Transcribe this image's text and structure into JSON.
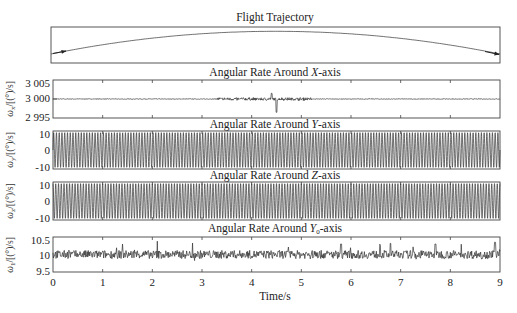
{
  "figure": {
    "xlabel": "Time/s",
    "x_ticks": [
      "0",
      "1",
      "2",
      "3",
      "4",
      "5",
      "6",
      "7",
      "8",
      "9"
    ]
  },
  "chart_data": [
    {
      "type": "line",
      "title": "Flight Trajectory",
      "xlabel": "",
      "ylabel": "",
      "description": "Gentle arc from left to right with arrowheads at both ends; apex near center",
      "x": [
        0,
        1.5,
        3,
        4.5,
        6,
        7.5,
        9
      ],
      "values": [
        0.25,
        0.58,
        0.8,
        0.88,
        0.8,
        0.58,
        0.25
      ],
      "grid": false
    },
    {
      "type": "line",
      "title": "Angular Rate Around X-axis",
      "title_parts": [
        "Angular Rate Around ",
        "X",
        "-axis"
      ],
      "ylabel": "ωx/[(°)/s]",
      "ylabel_sym": "ω",
      "ylabel_sub": "x",
      "ylabel_unit": "/[(°)/s]",
      "y_ticks": [
        "3 005",
        "3 000",
        "2 995"
      ],
      "ylim": [
        2995,
        3005
      ],
      "xlim": [
        0,
        9
      ],
      "baseline": 3000,
      "description": "Near-constant ~3000 with small noise; disturbance between 3.5 s and 5 s, positive spike ~+1.5 at 4.4 s and negative spike ~-3.5 at 4.5 s",
      "events": [
        {
          "t": 4.4,
          "value": 3001.5
        },
        {
          "t": 4.5,
          "value": 2996.5
        }
      ],
      "grid": false
    },
    {
      "type": "line",
      "title": "Angular Rate Around Y-axis",
      "title_parts": [
        "Angular Rate Around ",
        "Y",
        "-axis"
      ],
      "ylabel": "ωy/[(°)/s]",
      "ylabel_sym": "ω",
      "ylabel_sub": "y",
      "ylabel_unit": "/[(°)/s]",
      "y_ticks": [
        "10",
        "0",
        "-10"
      ],
      "ylim": [
        -12,
        12
      ],
      "xlim": [
        0,
        9
      ],
      "description": "Sinusoid amplitude ~11 (°)/s, ~18 cycles per second",
      "amplitude": 11,
      "frequency_hz": 18,
      "phase": 0,
      "grid": false
    },
    {
      "type": "line",
      "title": "Angular Rate Around Z-axis",
      "title_parts": [
        "Angular Rate Around ",
        "Z",
        "-axis"
      ],
      "ylabel": "ωz/[(°)/s]",
      "ylabel_sym": "ω",
      "ylabel_sub": "z",
      "ylabel_unit": "/[(°)/s]",
      "y_ticks": [
        "10",
        "0",
        "-10"
      ],
      "ylim": [
        -12,
        12
      ],
      "xlim": [
        0,
        9
      ],
      "description": "Sinusoid amplitude ~11 (°)/s, ~18 cycles per second, quarter-phase shifted from Y",
      "amplitude": 11,
      "frequency_hz": 18,
      "phase": 1.5708,
      "grid": false
    },
    {
      "type": "line",
      "title": "Angular Rate Around Y0-axis",
      "title_parts": [
        "Angular Rate Around ",
        "Y",
        "0",
        "-axis"
      ],
      "ylabel": "ω1/[(°)/s]",
      "ylabel_sym": "ω",
      "ylabel_sub": "1",
      "ylabel_unit": "/[(°)/s]",
      "y_ticks": [
        "10.5",
        "10",
        "9.5"
      ],
      "ylim": [
        9.5,
        10.5
      ],
      "xlim": [
        0,
        9
      ],
      "baseline": 10,
      "description": "Noisy signal around 10 (°)/s, fluctuations ±0.2 with occasional spikes to ~10.35",
      "noise_amplitude": 0.12,
      "spikes": [
        {
          "t": 1.4,
          "value": 10.3
        },
        {
          "t": 2.1,
          "value": 10.38
        },
        {
          "t": 5.8,
          "value": 10.3
        },
        {
          "t": 6.8,
          "value": 10.32
        },
        {
          "t": 7.7,
          "value": 10.3
        },
        {
          "t": 8.9,
          "value": 10.35
        }
      ],
      "grid": false
    }
  ]
}
